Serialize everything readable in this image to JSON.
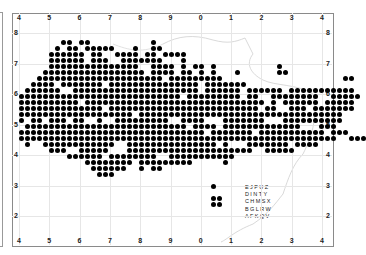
{
  "map": {
    "x_ticks": [
      "4",
      "5",
      "6",
      "7",
      "8",
      "9",
      "0",
      "1",
      "2",
      "3",
      "4"
    ],
    "y_ticks_left": [
      "8",
      "7",
      "6",
      "5",
      "4",
      "3",
      "2"
    ],
    "y_ticks_right": [
      "8",
      "7",
      "6",
      "5",
      "4",
      "3",
      "2"
    ],
    "corner_label": "4",
    "reference_code": [
      "EJPUZ",
      "DINTY",
      "CHMSX",
      "BGLRW",
      "AFKQV"
    ],
    "dot_color": "#000000",
    "grid": {
      "x0": 19,
      "y0": 41,
      "dx": 6,
      "dy": 6,
      "rows": [
        "..........##.##..........#...",
        ".........#.##.#####...#..##.",
        "........######.##..####.##.####",
        "........######.###..#######...#...................",
        "........###############..####.#.##.#..........#...",
        ".......#################.####.##.#.#...#......##..",
        "......#####################.#########....................##..",
        ".....####.#######.###############.#######.....................",
        "....######..#####################.######.######.###########....",
        "...###########################.#########.##..########..#####...",
        "...##########.##############################.#.######.#####...",
        "...##############.#########################.##..###.#######...",
        "...###################.##################################.....",
        "...#.##.###.##..#..#########..####...#######...##########.....",
        "....###########################.####.#############...###.....",
        "...###############################.#######.###########.###...",
        "...#####################################################..###",
        "....#..############..###############.#...#######.####.........",
        "........###..#####...#####################..#####.............",
        "...........######.########..###########....................",
        "..............########.#########.....#...................",
        "...............######..#.##..................................",
        "................###..........................................",
        "...............................................",
        "...................................#.........",
        "..............................................",
        "...................................##.......",
        "...................................##......."
      ]
    }
  }
}
